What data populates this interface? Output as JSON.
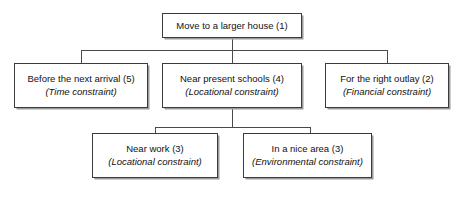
{
  "diagram": {
    "type": "hierarchy-tree",
    "colors": {
      "background": "#ffffff",
      "box_fill": "#ffffff",
      "box_border": "#3b3b3b",
      "box_shadow": "#9a9a9a",
      "connector": "#4a4a4a",
      "text": "#111111"
    },
    "nodes": [
      {
        "id": "root",
        "title": "Move to a larger house (1)",
        "subtitle": "",
        "level": 0,
        "x": 162,
        "y": 13,
        "width": 140,
        "height": 25
      },
      {
        "id": "time",
        "title": "Before the next arrival (5)",
        "subtitle": "(Time constraint)",
        "level": 1,
        "x": 14,
        "y": 63,
        "width": 134,
        "height": 45
      },
      {
        "id": "schools",
        "title": "Near present schools (4)",
        "subtitle": "(Locational constraint)",
        "level": 1,
        "x": 162,
        "y": 63,
        "width": 140,
        "height": 45
      },
      {
        "id": "outlay",
        "title": "For the right outlay (2)",
        "subtitle": "(Financial constraint)",
        "level": 1,
        "x": 325,
        "y": 63,
        "width": 124,
        "height": 45
      },
      {
        "id": "work",
        "title": "Near work (3)",
        "subtitle": "(Locational constraint)",
        "level": 2,
        "x": 92,
        "y": 133,
        "width": 126,
        "height": 45
      },
      {
        "id": "area",
        "title": "In a nice area (3)",
        "subtitle": "(Environmental constraint)",
        "level": 2,
        "x": 243,
        "y": 133,
        "width": 129,
        "height": 45
      }
    ],
    "edges": [
      {
        "from": "root",
        "to": "time",
        "bus_y": 50
      },
      {
        "from": "root",
        "to": "schools",
        "bus_y": 50
      },
      {
        "from": "root",
        "to": "outlay",
        "bus_y": 50
      },
      {
        "from": "schools",
        "to": "work",
        "bus_y": 127
      },
      {
        "from": "schools",
        "to": "area",
        "bus_y": 127
      }
    ],
    "connector_paths": {
      "upper_stem": "M 232 38 L 232 63",
      "upper_bus": "M 81 50 L 387 50",
      "upper_left_drop": "M 81 50 L 81 63",
      "upper_right_drop": "M 387 50 L 387 63",
      "lower_stem": "M 232 108 L 232 127",
      "lower_bus": "M 155 127 L 310 127",
      "lower_left_drop": "M 155 127 L 155 133",
      "lower_right_drop": "M 310 127 L 310 133"
    }
  }
}
